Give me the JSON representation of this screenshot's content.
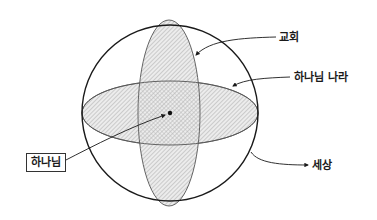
{
  "diagram": {
    "labels": {
      "church": "교회",
      "kingdom_of_god": "하나님 나라",
      "god": "하나님",
      "world": "세상"
    },
    "shapes": {
      "world_circle": {
        "cx": 170,
        "cy": 113,
        "r": 88
      },
      "church_ellipse": {
        "cx": 169,
        "cy": 113,
        "rx": 31,
        "ry": 93
      },
      "kingdom_ellipse": {
        "cx": 170,
        "cy": 113,
        "rx": 88,
        "ry": 32
      },
      "god_point": {
        "cx": 170,
        "cy": 113
      }
    },
    "colors": {
      "stroke": "#1a1a1a",
      "hatch": "#9a9a9a",
      "fill": "#e6e6e6",
      "background": "#ffffff"
    }
  }
}
